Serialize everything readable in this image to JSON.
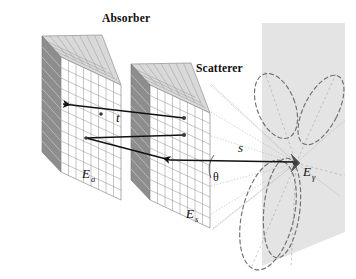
{
  "figure": {
    "type": "scientific-schematic",
    "background_color": "#ffffff",
    "width": 356,
    "height": 279
  },
  "titles": {
    "absorber": "Absorber",
    "scatterer": "Scatterer"
  },
  "symbols": {
    "absorber_field": {
      "base": "E",
      "sub": "a"
    },
    "scatterer_field": {
      "base": "E",
      "sub": "s"
    },
    "gamma_energy": {
      "base": "E",
      "sub": "γ"
    },
    "thickness": "t",
    "distance": "s",
    "angle": "θ"
  },
  "colors": {
    "slab_face": "#ffffff",
    "slab_grid_line": "#8a8a8a",
    "slab_top_face": "#d8d8d8",
    "slab_top_line": "#9a9a9a",
    "slab_side_face": "#8d8d8d",
    "slab_side_line": "#c9c9c9",
    "detector_plane": "#e3e3e3",
    "lobe_dash": "#6e6e6e",
    "cone_dotted": "#b0b0b0",
    "arrow": "#111111",
    "marker": "#4a4a4a",
    "text": "#0d0d0d"
  },
  "slabs": {
    "absorber": {
      "columns": 8,
      "rows": 11,
      "name": "absorber-slab"
    },
    "scatterer": {
      "columns": 8,
      "rows": 11,
      "name": "scatterer-slab"
    }
  },
  "detector": {
    "plane_label": "detector-plane",
    "lobe_count": 4
  }
}
